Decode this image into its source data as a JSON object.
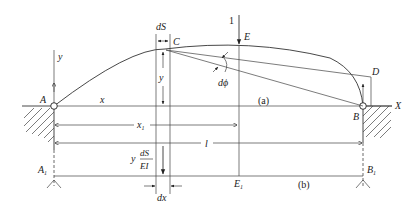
{
  "figure": {
    "type": "structural-mechanics-diagram",
    "parts": {
      "a": "(a)",
      "b": "(b)"
    }
  },
  "labels": {
    "point_A": "A",
    "point_B": "B",
    "point_C": "C",
    "point_D": "D",
    "point_E": "E",
    "point_A1": "A",
    "point_A1_sub": "1",
    "point_B1": "B",
    "point_B1_sub": "1",
    "point_E1": "E",
    "point_E1_sub": "1",
    "axis_X": "X",
    "axis_y": "y",
    "dim_x": "x",
    "dim_x1": "x",
    "dim_x1_sub": "1",
    "dim_l": "l",
    "dim_y": "y",
    "dS": "dS",
    "dphi": "dϕ",
    "dx": "dx",
    "load_value": "1",
    "load_y_prefix": "y",
    "load_frac_num": "dS",
    "load_frac_den": "EI"
  },
  "colors": {
    "line": "#333333",
    "background": "#ffffff"
  }
}
